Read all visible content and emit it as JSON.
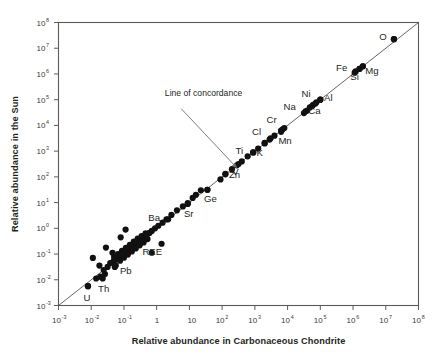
{
  "chart_data": {
    "type": "scatter",
    "title": "",
    "xlabel": "Relative abundance in Carbonaceous Chondrite",
    "ylabel": "Relative abundance in the Sun",
    "xscale": "log",
    "yscale": "log",
    "xlim": [
      -3,
      8
    ],
    "ylim": [
      -3,
      8
    ],
    "grid": false,
    "legend": null,
    "xticks": [
      {
        "value": -3,
        "label": "10",
        "exp": "-3"
      },
      {
        "value": -2,
        "label": "10",
        "exp": "-2"
      },
      {
        "value": -1,
        "label": "10",
        "exp": "-1"
      },
      {
        "value": 0,
        "label": "1",
        "exp": ""
      },
      {
        "value": 1,
        "label": "10",
        "exp": ""
      },
      {
        "value": 2,
        "label": "10",
        "exp": "2"
      },
      {
        "value": 3,
        "label": "10",
        "exp": "3"
      },
      {
        "value": 4,
        "label": "10",
        "exp": "4"
      },
      {
        "value": 5,
        "label": "10",
        "exp": "5"
      },
      {
        "value": 6,
        "label": "10",
        "exp": "6"
      },
      {
        "value": 7,
        "label": "10",
        "exp": "7"
      },
      {
        "value": 8,
        "label": "10",
        "exp": "8"
      }
    ],
    "yticks": [
      {
        "value": 8,
        "label": "10",
        "exp": "8"
      },
      {
        "value": 7,
        "label": "10",
        "exp": "7"
      },
      {
        "value": 6,
        "label": "10",
        "exp": "6"
      },
      {
        "value": 5,
        "label": "10",
        "exp": "5"
      },
      {
        "value": 4,
        "label": "10",
        "exp": "4"
      },
      {
        "value": 3,
        "label": "10",
        "exp": "3"
      },
      {
        "value": 2,
        "label": "10",
        "exp": "2"
      },
      {
        "value": 1,
        "label": "10",
        "exp": "1"
      },
      {
        "value": 0,
        "label": "10",
        "exp": "0"
      },
      {
        "value": -1,
        "label": "10",
        "exp": "-1"
      },
      {
        "value": -2,
        "label": "10",
        "exp": "-2"
      },
      {
        "value": -3,
        "label": "10",
        "exp": "-3"
      }
    ],
    "reference_line": {
      "name": "Line of concordance",
      "from": [
        -3,
        -3
      ],
      "to": [
        8,
        8
      ],
      "slope": 1,
      "intercept": 0
    },
    "annotations": [
      {
        "text": "Line of concordance",
        "text_x": 0.25,
        "text_y": 5.15,
        "arrow_from": [
          0.75,
          4.65
        ],
        "arrow_to": [
          2.45,
          2.35
        ]
      }
    ],
    "point_size": 3.1,
    "point_color": "#111111",
    "labeled_points": [
      {
        "label": "O",
        "x": 7.25,
        "y": 7.35,
        "dx": -11,
        "dy": 1
      },
      {
        "label": "Fe",
        "x": 6.05,
        "y": 6.05,
        "dx": -13,
        "dy": -2
      },
      {
        "label": "Si",
        "x": 6.2,
        "y": 6.2,
        "dx": -5,
        "dy": 11
      },
      {
        "label": "Mg",
        "x": 6.3,
        "y": 6.3,
        "dx": 9,
        "dy": 8
      },
      {
        "label": "Ni",
        "x": 4.75,
        "y": 4.75,
        "dx": -6,
        "dy": -9
      },
      {
        "label": "Na",
        "x": 4.55,
        "y": 4.55,
        "dx": -16,
        "dy": -1
      },
      {
        "label": "Al",
        "x": 5.0,
        "y": 5.0,
        "dx": 8,
        "dy": 1
      },
      {
        "label": "Ca",
        "x": 4.85,
        "y": 4.85,
        "dx": -1,
        "dy": 10
      },
      {
        "label": "Cr",
        "x": 3.85,
        "y": 3.85,
        "dx": -11,
        "dy": -6
      },
      {
        "label": "Mn",
        "x": 3.8,
        "y": 3.8,
        "dx": 4,
        "dy": 13
      },
      {
        "label": "Cl",
        "x": 3.45,
        "y": 3.45,
        "dx": -13,
        "dy": -5
      },
      {
        "label": "K",
        "x": 3.3,
        "y": 3.3,
        "dx": -5,
        "dy": 13
      },
      {
        "label": "Ti",
        "x": 2.95,
        "y": 2.95,
        "dx": -14,
        "dy": 2
      },
      {
        "label": "Zn",
        "x": 2.5,
        "y": 2.5,
        "dx": -4,
        "dy": 14
      },
      {
        "label": "V",
        "x": 2.1,
        "y": 2.1,
        "dx": 10,
        "dy": 1
      },
      {
        "label": "Ge",
        "x": 1.55,
        "y": 1.5,
        "dx": 3,
        "dy": 12
      },
      {
        "label": "Sr",
        "x": 0.95,
        "y": 0.95,
        "dx": 1,
        "dy": 13
      },
      {
        "label": "Ba",
        "x": 0.35,
        "y": 0.35,
        "dx": -14,
        "dy": 2
      },
      {
        "label": "REE",
        "x": -0.5,
        "y": -0.55,
        "dx": 12,
        "dy": 13
      },
      {
        "label": "Pb",
        "x": -1.25,
        "y": -1.45,
        "dx": 10,
        "dy": 8
      },
      {
        "label": "Th",
        "x": -1.65,
        "y": -1.95,
        "dx": 1,
        "dy": 14
      },
      {
        "label": "U",
        "x": -2.1,
        "y": -2.25,
        "dx": -1,
        "dy": 15
      }
    ],
    "points": [
      {
        "x": 7.25,
        "y": 7.35
      },
      {
        "x": 6.3,
        "y": 6.3
      },
      {
        "x": 6.2,
        "y": 6.2
      },
      {
        "x": 6.08,
        "y": 6.1
      },
      {
        "x": 5.0,
        "y": 5.0
      },
      {
        "x": 4.88,
        "y": 4.9
      },
      {
        "x": 4.78,
        "y": 4.8
      },
      {
        "x": 4.68,
        "y": 4.7
      },
      {
        "x": 4.6,
        "y": 4.58
      },
      {
        "x": 4.5,
        "y": 4.48
      },
      {
        "x": 3.9,
        "y": 3.9
      },
      {
        "x": 3.8,
        "y": 3.75
      },
      {
        "x": 3.6,
        "y": 3.6
      },
      {
        "x": 3.48,
        "y": 3.5
      },
      {
        "x": 3.3,
        "y": 3.32
      },
      {
        "x": 3.1,
        "y": 3.1
      },
      {
        "x": 2.95,
        "y": 2.95
      },
      {
        "x": 2.78,
        "y": 2.8
      },
      {
        "x": 2.6,
        "y": 2.6
      },
      {
        "x": 2.45,
        "y": 2.45
      },
      {
        "x": 2.3,
        "y": 2.3
      },
      {
        "x": 2.1,
        "y": 2.12
      },
      {
        "x": 1.95,
        "y": 1.9
      },
      {
        "x": 1.55,
        "y": 1.5
      },
      {
        "x": 1.35,
        "y": 1.48
      },
      {
        "x": 1.2,
        "y": 1.3
      },
      {
        "x": 1.1,
        "y": 1.18
      },
      {
        "x": 0.95,
        "y": 0.98
      },
      {
        "x": 0.8,
        "y": 0.85
      },
      {
        "x": 0.62,
        "y": 0.7
      },
      {
        "x": 0.45,
        "y": 0.52
      },
      {
        "x": 0.3,
        "y": 0.35
      },
      {
        "x": 0.18,
        "y": 0.22
      },
      {
        "x": 0.05,
        "y": 0.1
      },
      {
        "x": -0.05,
        "y": 0.0
      },
      {
        "x": -0.15,
        "y": -0.1
      },
      {
        "x": -0.22,
        "y": -0.18
      },
      {
        "x": -0.3,
        "y": -0.25
      },
      {
        "x": -0.36,
        "y": -0.32
      },
      {
        "x": -0.42,
        "y": -0.38
      },
      {
        "x": -0.48,
        "y": -0.44
      },
      {
        "x": -0.54,
        "y": -0.5
      },
      {
        "x": -0.6,
        "y": -0.56
      },
      {
        "x": -0.66,
        "y": -0.62
      },
      {
        "x": -0.72,
        "y": -0.68
      },
      {
        "x": -0.78,
        "y": -0.74
      },
      {
        "x": -0.84,
        "y": -0.8
      },
      {
        "x": -0.9,
        "y": -0.86
      },
      {
        "x": -0.96,
        "y": -0.92
      },
      {
        "x": -1.02,
        "y": -0.98
      },
      {
        "x": -1.08,
        "y": -1.04
      },
      {
        "x": -1.14,
        "y": -1.1
      },
      {
        "x": -1.2,
        "y": -1.16
      },
      {
        "x": -1.26,
        "y": -1.22
      },
      {
        "x": -1.32,
        "y": -1.28
      },
      {
        "x": -0.28,
        "y": -0.42
      },
      {
        "x": -0.4,
        "y": -0.55
      },
      {
        "x": -0.52,
        "y": -0.66
      },
      {
        "x": -0.64,
        "y": -0.78
      },
      {
        "x": -0.76,
        "y": -0.9
      },
      {
        "x": -0.88,
        "y": -1.02
      },
      {
        "x": -1.0,
        "y": -1.14
      },
      {
        "x": -1.12,
        "y": -1.26
      },
      {
        "x": -0.34,
        "y": -0.2
      },
      {
        "x": -0.46,
        "y": -0.3
      },
      {
        "x": -0.58,
        "y": -0.4
      },
      {
        "x": -0.7,
        "y": -0.52
      },
      {
        "x": -0.82,
        "y": -0.64
      },
      {
        "x": -0.94,
        "y": -0.76
      },
      {
        "x": -1.06,
        "y": -0.88
      },
      {
        "x": -1.18,
        "y": -1.0
      },
      {
        "x": -1.3,
        "y": -1.12
      },
      {
        "x": -1.42,
        "y": -1.35
      },
      {
        "x": -1.5,
        "y": -1.5
      },
      {
        "x": -1.62,
        "y": -1.62
      },
      {
        "x": -1.72,
        "y": -1.88
      },
      {
        "x": -1.58,
        "y": -1.78
      },
      {
        "x": -1.85,
        "y": -1.95
      },
      {
        "x": -1.28,
        "y": -1.5
      },
      {
        "x": -2.1,
        "y": -2.25
      },
      {
        "x": -1.95,
        "y": -1.15
      },
      {
        "x": -1.55,
        "y": -0.75
      },
      {
        "x": -1.1,
        "y": -0.35
      },
      {
        "x": -0.95,
        "y": -0.05
      },
      {
        "x": -1.35,
        "y": -0.95
      },
      {
        "x": -0.15,
        "y": -0.95
      },
      {
        "x": 0.15,
        "y": -0.6
      },
      {
        "x": -1.75,
        "y": -1.45
      }
    ]
  }
}
